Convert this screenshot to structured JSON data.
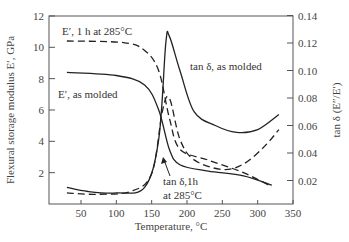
{
  "chart_data": {
    "type": "line",
    "title": "",
    "xlabel": "Temperature, °C",
    "ylabel_left": "Flexural storage modulus E′, GPa",
    "ylabel_right": "tan δ (E″/E′)",
    "xlim": [
      5,
      350
    ],
    "ylim_left": [
      0,
      12
    ],
    "ylim_right": [
      0.0035,
      0.14
    ],
    "x_ticks": [
      50,
      100,
      150,
      200,
      250,
      300,
      350
    ],
    "y_left_ticks": [
      2,
      4,
      6,
      8,
      10,
      12
    ],
    "y_right_ticks": [
      "0.02",
      "0.04",
      "0.06",
      "0.08",
      "0.10",
      "0.12",
      "0.14"
    ],
    "grid": false,
    "series": [
      {
        "name": "E′, as molded",
        "axis": "left",
        "style": "solid",
        "x": [
          30,
          100,
          140,
          160,
          175,
          190,
          230,
          280,
          320
        ],
        "y": [
          8.4,
          8.2,
          7.6,
          6.0,
          3.5,
          2.5,
          2.1,
          1.8,
          1.2
        ]
      },
      {
        "name": "E′, 1 h at 285°C",
        "axis": "left",
        "style": "dashed",
        "x": [
          30,
          110,
          140,
          160,
          175,
          190,
          230,
          280,
          320
        ],
        "y": [
          10.4,
          10.3,
          9.8,
          8.5,
          5.5,
          3.5,
          2.8,
          2.0,
          1.1
        ]
      },
      {
        "name": "tan δ, as molded",
        "axis": "right",
        "style": "solid",
        "x": [
          30,
          60,
          100,
          140,
          160,
          170,
          175,
          190,
          210,
          240,
          270,
          300,
          330
        ],
        "y": [
          0.015,
          0.012,
          0.011,
          0.015,
          0.05,
          0.12,
          0.125,
          0.1,
          0.07,
          0.06,
          0.055,
          0.057,
          0.068
        ]
      },
      {
        "name": "tan δ, 1h at 285°C",
        "axis": "right",
        "style": "dashed",
        "x": [
          30,
          70,
          120,
          150,
          165,
          175,
          190,
          210,
          250,
          280,
          310,
          330
        ],
        "y": [
          0.011,
          0.01,
          0.012,
          0.025,
          0.07,
          0.08,
          0.05,
          0.035,
          0.028,
          0.032,
          0.045,
          0.057
        ]
      }
    ],
    "annotations": [
      {
        "text": "E′, 1 h at 285°C"
      },
      {
        "text": "E′, as molded"
      },
      {
        "text": "tan δ, as molded"
      },
      {
        "text": "tan δ,1h"
      },
      {
        "text": "at 285°C"
      }
    ]
  }
}
